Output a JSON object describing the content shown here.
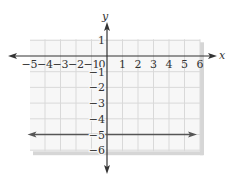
{
  "chart_data": {
    "type": "line",
    "title": "",
    "xlabel": "x",
    "ylabel": "y",
    "xlim": [
      -5,
      6
    ],
    "ylim": [
      -6,
      1
    ],
    "grid": true,
    "x_ticks": [
      -5,
      -4,
      -3,
      -2,
      -1,
      0,
      1,
      2,
      3,
      4,
      5,
      6
    ],
    "x_tick_labels": [
      "−5",
      "−4",
      "−3",
      "−2",
      "−1",
      "0",
      "1",
      "2",
      "3",
      "4",
      "5",
      "6"
    ],
    "y_ticks": [
      1,
      -1,
      -2,
      -3,
      -4,
      -5,
      -6
    ],
    "y_tick_labels": [
      "1",
      "−1",
      "−2",
      "−3",
      "−4",
      "−5",
      "−6"
    ],
    "series": [
      {
        "name": "y = -5",
        "equation": "y = -5",
        "x": [
          -5,
          6
        ],
        "y": [
          -5,
          -5
        ],
        "arrows": "both",
        "color": "#555555"
      }
    ],
    "legend": null
  },
  "colors": {
    "grid": "#d9d9d9",
    "grid_bg": "#f7f7f7",
    "shadow": "#d6d6d6",
    "axis": "#333333",
    "line": "#555555"
  }
}
